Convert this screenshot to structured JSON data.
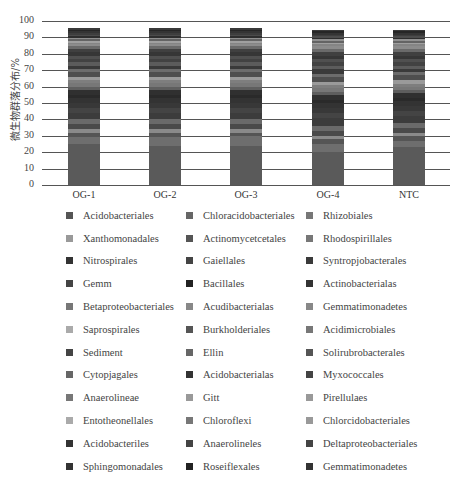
{
  "chart_data": {
    "type": "bar",
    "stacked": true,
    "title": "",
    "xlabel": "",
    "ylabel": "微生物群落分布/%",
    "ylim": [
      0,
      100
    ],
    "yticks": [
      0,
      10,
      20,
      30,
      40,
      50,
      60,
      70,
      80,
      90,
      100
    ],
    "grid": true,
    "legend_position": "bottom",
    "categories": [
      "OG-1",
      "OG-2",
      "OG-3",
      "OG-4",
      "NTC"
    ],
    "series": [
      {
        "name": "Acidobacteriales",
        "color": "#5a5a5a",
        "values": [
          25,
          24,
          24,
          20,
          23
        ]
      },
      {
        "name": "Chloracidobacteriales",
        "color": "#6e6e6e",
        "values": [
          4,
          5,
          6,
          5,
          4
        ]
      },
      {
        "name": "Rhizobiales",
        "color": "#555555",
        "values": [
          3,
          3,
          2,
          3,
          3
        ]
      },
      {
        "name": "Xanthomonadales",
        "color": "#8a8a8a",
        "values": [
          2,
          2,
          2,
          2,
          2
        ]
      },
      {
        "name": "Actinomycetcetales",
        "color": "#4a4a4a",
        "values": [
          3,
          3,
          3,
          3,
          3
        ]
      },
      {
        "name": "Rhodospirillales",
        "color": "#6a6a6a",
        "values": [
          3,
          3,
          3,
          3,
          3
        ]
      },
      {
        "name": "Nitrospirales",
        "color": "#3c3c3c",
        "values": [
          4,
          4,
          4,
          5,
          4
        ]
      },
      {
        "name": "Gaiellales",
        "color": "#444444",
        "values": [
          3,
          3,
          3,
          3,
          3
        ]
      },
      {
        "name": "Syntropjobacterales",
        "color": "#383838",
        "values": [
          3,
          3,
          3,
          3,
          3
        ]
      },
      {
        "name": "Gemm",
        "color": "#333333",
        "values": [
          3,
          3,
          3,
          3,
          3
        ]
      },
      {
        "name": "Bacillales",
        "color": "#2a2a2a",
        "values": [
          2,
          2,
          2,
          2,
          2
        ]
      },
      {
        "name": "Actinobacterialas",
        "color": "#303030",
        "values": [
          3,
          3,
          3,
          3,
          3
        ]
      },
      {
        "name": "Betaproteobacteriales",
        "color": "#5e5e5e",
        "values": [
          2,
          2,
          2,
          2,
          2
        ]
      },
      {
        "name": "Acudibacterialas",
        "color": "#777777",
        "values": [
          2,
          2,
          2,
          2,
          2
        ]
      },
      {
        "name": "Gemmatimonadetes",
        "color": "#7e7e7e",
        "values": [
          2,
          2,
          2,
          2,
          2
        ]
      },
      {
        "name": "Saprospirales",
        "color": "#9a9a9a",
        "values": [
          2,
          2,
          2,
          2,
          2
        ]
      },
      {
        "name": "Burkholderiales",
        "color": "#4e4e4e",
        "values": [
          3,
          3,
          3,
          3,
          3
        ]
      },
      {
        "name": "Acidimicrobiales",
        "color": "#6c6c6c",
        "values": [
          2,
          2,
          2,
          2,
          2
        ]
      },
      {
        "name": "Sediment",
        "color": "#3a3a3a",
        "values": [
          2,
          2,
          2,
          3,
          2
        ]
      },
      {
        "name": "Ellin",
        "color": "#5c5c5c",
        "values": [
          2,
          2,
          2,
          2,
          2
        ]
      },
      {
        "name": "Solirubrobacterales",
        "color": "#424242",
        "values": [
          2,
          2,
          2,
          2,
          2
        ]
      },
      {
        "name": "Cytopjagales",
        "color": "#505050",
        "values": [
          2,
          2,
          2,
          2,
          2
        ]
      },
      {
        "name": "Acidobacterialas",
        "color": "#363636",
        "values": [
          2,
          2,
          2,
          2,
          2
        ]
      },
      {
        "name": "Myxococcales",
        "color": "#404040",
        "values": [
          2,
          2,
          2,
          2,
          2
        ]
      },
      {
        "name": "Anaerolineae",
        "color": "#6a6a6a",
        "values": [
          2,
          2,
          2,
          2,
          2
        ]
      },
      {
        "name": "Gitt",
        "color": "#8c8c8c",
        "values": [
          1,
          1,
          1,
          2,
          2
        ]
      },
      {
        "name": "Pirellulaes",
        "color": "#858585",
        "values": [
          1,
          1,
          1,
          1,
          1
        ]
      },
      {
        "name": "Entotheonellales",
        "color": "#a0a0a0",
        "values": [
          1,
          1,
          1,
          1,
          1
        ]
      },
      {
        "name": "Chloroflexi",
        "color": "#646464",
        "values": [
          1,
          1,
          1,
          1,
          1
        ]
      },
      {
        "name": "Chlorcidobacteriales",
        "color": "#909090",
        "values": [
          1,
          1,
          1,
          1,
          1
        ]
      },
      {
        "name": "Acidobacteriles",
        "color": "#2e2e2e",
        "values": [
          1,
          1,
          1,
          1,
          1
        ]
      },
      {
        "name": "Anaerolineles",
        "color": "#4c4c4c",
        "values": [
          1,
          1,
          1,
          1,
          1
        ]
      },
      {
        "name": "Deltaproteobacteriales",
        "color": "#3e3e3e",
        "values": [
          1,
          1,
          1,
          1,
          1
        ]
      },
      {
        "name": "Sphingomonadales",
        "color": "#343434",
        "values": [
          1,
          1,
          1,
          1,
          1
        ]
      },
      {
        "name": "Roseiflexales",
        "color": "#262626",
        "values": [
          1,
          1,
          1,
          1,
          1
        ]
      },
      {
        "name": "Gemmatimonadetes",
        "color": "#3a3a3a",
        "values": [
          1,
          1,
          1,
          1,
          1
        ]
      }
    ]
  },
  "legend": {
    "rows": [
      [
        "Acidobacteriales",
        "Chloracidobacteriales",
        "Rhizobiales"
      ],
      [
        "Xanthomonadales",
        "Actinomycetcetales",
        "Rhodospirillales"
      ],
      [
        "Nitrospirales",
        "Gaiellales",
        "Syntropjobacterales"
      ],
      [
        "Gemm",
        "Bacillales",
        "Actinobacterialas"
      ],
      [
        "Betaproteobacteriales",
        "Acudibacterialas",
        "Gemmatimonadetes"
      ],
      [
        "Saprospirales",
        "Burkholderiales",
        "Acidimicrobiales"
      ],
      [
        "Sediment",
        "Ellin",
        "Solirubrobacterales"
      ],
      [
        "Cytopjagales",
        "Acidobacterialas",
        "Myxococcales"
      ],
      [
        "Anaerolineae",
        "Gitt",
        "Pirellulaes"
      ],
      [
        "Entotheonellales",
        "Chloroflexi",
        "Chlorcidobacteriales"
      ],
      [
        "Acidobacteriles",
        "Anaerolineles",
        "Deltaproteobacteriales"
      ],
      [
        "Sphingomonadales",
        "Roseiflexales",
        "Gemmatimonadetes"
      ]
    ]
  }
}
